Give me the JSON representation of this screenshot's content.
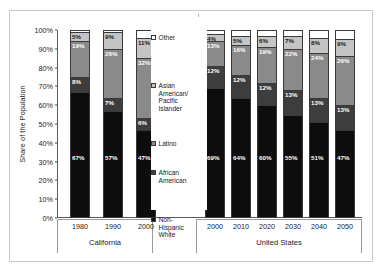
{
  "chart_data": {
    "type": "bar",
    "subtype": "stacked-100-percent",
    "title": "",
    "xlabel": "",
    "ylabel": "Share of the Population",
    "ylim": [
      0,
      100
    ],
    "ytick_labels": [
      "0%",
      "10%",
      "20%",
      "30%",
      "40%",
      "50%",
      "60%",
      "70%",
      "80%",
      "90%",
      "100%"
    ],
    "ytick_values": [
      0,
      10,
      20,
      30,
      40,
      50,
      60,
      70,
      80,
      90,
      100
    ],
    "grid": false,
    "legend_position": "center",
    "stack_order_bottom_to_top": [
      "Non-Hispanic White",
      "African American",
      "Latino",
      "Asian American/Pacific Islander",
      "Other"
    ],
    "series": [
      {
        "name": "Non-Hispanic White",
        "color": "#0d0d0d",
        "values": [
          67,
          57,
          47,
          69,
          64,
          60,
          55,
          51,
          47
        ]
      },
      {
        "name": "African American",
        "color": "#3d3d3d",
        "values": [
          8,
          7,
          6,
          12,
          12,
          12,
          13,
          13,
          13
        ]
      },
      {
        "name": "Latino",
        "color": "#8a8a8a",
        "values": [
          19,
          26,
          32,
          13,
          16,
          19,
          22,
          24,
          26
        ]
      },
      {
        "name": "Asian American/Pacific Islander",
        "color": "#c4c4c4",
        "values": [
          5,
          9,
          11,
          4,
          5,
          6,
          7,
          8,
          9
        ]
      },
      {
        "name": "Other",
        "color": "#ffffff",
        "values": [
          1,
          1,
          4,
          2,
          3,
          3,
          3,
          4,
          5
        ]
      }
    ],
    "categories": [
      "1980",
      "1990",
      "2000",
      "2000",
      "2010",
      "2020",
      "2030",
      "2040",
      "2050"
    ],
    "groups": [
      {
        "label": "California",
        "categories": [
          "1980",
          "1990",
          "2000"
        ]
      },
      {
        "label": "United States",
        "categories": [
          "2000",
          "2010",
          "2020",
          "2030",
          "2040",
          "2050"
        ]
      }
    ],
    "data_labels": [
      {
        "bar": "ca-1980",
        "Non-Hispanic White": "67%",
        "African American": "8%",
        "Latino": "19%",
        "Asian American/Pacific Islander": "5%",
        "Other": ""
      },
      {
        "bar": "ca-1990",
        "Non-Hispanic White": "57%",
        "African American": "7%",
        "Latino": "26%",
        "Asian American/Pacific Islander": "9%",
        "Other": ""
      },
      {
        "bar": "ca-2000",
        "Non-Hispanic White": "47%",
        "African American": "6%",
        "Latino": "32%",
        "Asian American/Pacific Islander": "11%",
        "Other": ""
      },
      {
        "bar": "us-2000",
        "Non-Hispanic White": "69%",
        "African American": "12%",
        "Latino": "13%",
        "Asian American/Pacific Islander": "4%",
        "Other": ""
      },
      {
        "bar": "us-2010",
        "Non-Hispanic White": "64%",
        "African American": "12%",
        "Latino": "16%",
        "Asian American/Pacific Islander": "5%",
        "Other": ""
      },
      {
        "bar": "us-2020",
        "Non-Hispanic White": "60%",
        "African American": "12%",
        "Latino": "19%",
        "Asian American/Pacific Islander": "6%",
        "Other": ""
      },
      {
        "bar": "us-2030",
        "Non-Hispanic White": "55%",
        "African American": "13%",
        "Latino": "22%",
        "Asian American/Pacific Islander": "7%",
        "Other": ""
      },
      {
        "bar": "us-2040",
        "Non-Hispanic White": "51%",
        "African American": "13%",
        "Latino": "24%",
        "Asian American/Pacific Islander": "8%",
        "Other": ""
      },
      {
        "bar": "us-2050",
        "Non-Hispanic White": "47%",
        "African American": "13%",
        "Latino": "26%",
        "Asian American/Pacific Islander": "9%",
        "Other": ""
      }
    ],
    "legend": [
      {
        "label": "Other",
        "color": "#ffffff"
      },
      {
        "label": "Asian\nAmerican/\nPacific\nIslander",
        "color": "#c4c4c4"
      },
      {
        "label": "Latino",
        "color": "#8a8a8a"
      },
      {
        "label": "African\nAmerican",
        "color": "#3d3d3d"
      },
      {
        "label": "Non-\nHispanic\nWhite",
        "color": "#0d0d0d"
      }
    ]
  },
  "axis": {
    "y_title": "Share of the Population"
  },
  "colors": {
    "frame": "#8d8d8d",
    "axis": "#5a5a5a",
    "bar_outline": "#3a3a3a",
    "label_light": "#ffffff",
    "label_dark": "#1a1a1a",
    "background": "#ffffff"
  }
}
